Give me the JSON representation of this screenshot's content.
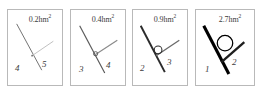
{
  "figure": {
    "kind": "angle-comparison-strip",
    "panel_count": 4,
    "border_color": "#b9b9b9",
    "background": "#ffffff",
    "unit": "hm",
    "unit_exponent": "2"
  },
  "panels": [
    {
      "id": "panel-1",
      "area_value": "0.2",
      "area_unit": "hm",
      "area_exponent": "2",
      "area_text": "0.2hm",
      "left_ray_label": "4",
      "right_ray_label": "5",
      "marker": "dot",
      "marker_size": 1.4,
      "stroke_width": 1.0,
      "stroke_color": "#6e6e6e",
      "right_stroke_color": "#bdbdbd"
    },
    {
      "id": "panel-2",
      "area_value": "0.4",
      "area_unit": "hm",
      "area_exponent": "2",
      "area_text": "0.4hm",
      "left_ray_label": "3",
      "right_ray_label": "4",
      "marker": "small-circle",
      "marker_size": 3.0,
      "stroke_width": 1.2,
      "stroke_color": "#585858",
      "right_stroke_color": "#8a8a8a"
    },
    {
      "id": "panel-3",
      "area_value": "0.9",
      "area_unit": "hm",
      "area_exponent": "2",
      "area_text": "0.9hm",
      "left_ray_label": "2",
      "right_ray_label": "3",
      "marker": "medium-circle",
      "marker_size": 5.5,
      "stroke_width": 2.0,
      "stroke_color": "#2b2b2b",
      "right_stroke_color": "#6a6a6a"
    },
    {
      "id": "panel-4",
      "area_value": "2.7",
      "area_unit": "hm",
      "area_exponent": "2",
      "area_text": "2.7hm",
      "left_ray_label": "1",
      "right_ray_label": "2",
      "marker": "large-circle",
      "marker_size": 10.0,
      "stroke_width": 3.2,
      "stroke_color": "#000000",
      "right_stroke_color": "#1f1f1f"
    }
  ]
}
